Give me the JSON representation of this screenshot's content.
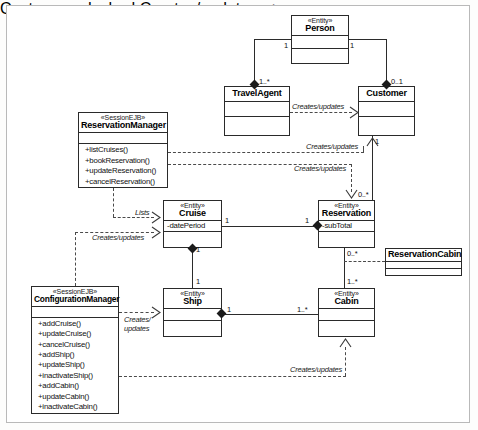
{
  "diagram": {
    "type": "uml-class-diagram",
    "stereotype_entity": "«Entity»",
    "stereotype_session": "«SessionEJB»",
    "classes": [
      {
        "id": "person",
        "name": "Person",
        "stereotype": "«Entity»",
        "attributes": [],
        "operations": []
      },
      {
        "id": "travelagent",
        "name": "TravelAgent",
        "stereotype": "",
        "attributes": [],
        "operations": []
      },
      {
        "id": "customer",
        "name": "Customer",
        "stereotype": "",
        "attributes": [],
        "operations": []
      },
      {
        "id": "resmgr",
        "name": "ReservationManager",
        "stereotype": "«SessionEJB»",
        "attributes": [],
        "operations": [
          "+listCruises()",
          "+bookReservation()",
          "+updateReservation()",
          "+cancelReservation()"
        ]
      },
      {
        "id": "cruise",
        "name": "Cruise",
        "stereotype": "«Entity»",
        "attributes": [
          "-datePeriod"
        ],
        "operations": []
      },
      {
        "id": "reservation",
        "name": "Reservation",
        "stereotype": "«Entity»",
        "attributes": [
          "-subTotal"
        ],
        "operations": []
      },
      {
        "id": "rescabin",
        "name": "ReservationCabin",
        "stereotype": "",
        "attributes": [],
        "operations": []
      },
      {
        "id": "configmgr",
        "name": "ConfigurationManager",
        "stereotype": "«SessionEJB»",
        "attributes": [],
        "operations": [
          "+addCruise()",
          "+updateCruise()",
          "+cancelCruise()",
          "+addShip()",
          "+updateShip()",
          "+inactivateShip()",
          "+addCabin()",
          "+updateCabin()",
          "+inactivateCabin()"
        ]
      },
      {
        "id": "ship",
        "name": "Ship",
        "stereotype": "«Entity»",
        "attributes": [],
        "operations": []
      },
      {
        "id": "cabin",
        "name": "Cabin",
        "stereotype": "«Entity»",
        "attributes": [],
        "operations": []
      }
    ],
    "labels": {
      "creates_updates": "Creates/updates",
      "creates_updates_wrap_1": "Creates/",
      "creates_updates_wrap_2": "updates",
      "lists": "Lists"
    },
    "multiplicities": {
      "person_left": "1",
      "person_right": "1",
      "travelagent_end": "1..*",
      "customer_end": "0..1",
      "customer_res": "1",
      "reservation_cust": "0..*",
      "cruise_res_left": "1",
      "reservation_cruise": "1",
      "cruise_ship_top": "1",
      "ship_cruise": "1",
      "reservation_cabin": "0..*",
      "cabin_reservation": "1..*",
      "ship_cabin_left": "1",
      "cabin_ship": "1..*"
    },
    "colors": {
      "line": "#2b2b2b",
      "dashed_line": "#4a4a4a",
      "box_fill": "#ffffff",
      "frame": "#b9b9b9"
    }
  }
}
